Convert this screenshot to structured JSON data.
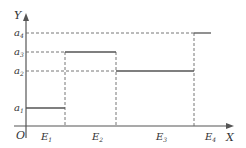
{
  "diagram": {
    "type": "step-function",
    "axes": {
      "x_label": "X",
      "y_label": "Y",
      "origin_label": "O"
    },
    "y_levels": [
      {
        "name": "a",
        "sub": "1"
      },
      {
        "name": "a",
        "sub": "2"
      },
      {
        "name": "a",
        "sub": "3"
      },
      {
        "name": "a",
        "sub": "4"
      }
    ],
    "intervals": [
      {
        "name": "E",
        "sub": "1",
        "level": "a1"
      },
      {
        "name": "E",
        "sub": "2",
        "level": "a3"
      },
      {
        "name": "E",
        "sub": "3",
        "level": "a2"
      },
      {
        "name": "E",
        "sub": "4",
        "level": "a4"
      }
    ],
    "colors": {
      "line": "#555555",
      "dashed": "#555555",
      "text": "#333333"
    }
  }
}
